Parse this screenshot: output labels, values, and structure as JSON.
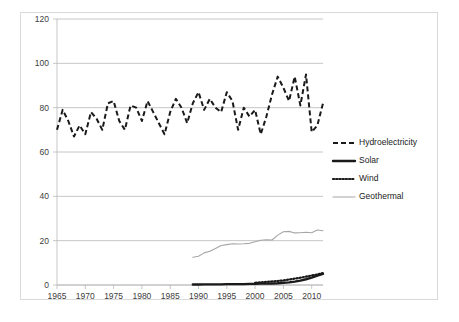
{
  "chart_data": {
    "type": "line",
    "title": "",
    "xlabel": "",
    "ylabel": "",
    "xlim": [
      1965,
      2012
    ],
    "ylim": [
      0,
      120
    ],
    "x_ticks": [
      1965,
      1970,
      1975,
      1980,
      1985,
      1990,
      1995,
      2000,
      2005,
      2010
    ],
    "y_ticks": [
      0,
      20,
      40,
      60,
      80,
      100,
      120
    ],
    "grid": "horizontal",
    "legend_position": "right",
    "series": [
      {
        "name": "Hydroelectricity",
        "style": "dashed",
        "color": "#1a1a1a",
        "x": [
          1965,
          1966,
          1967,
          1968,
          1969,
          1970,
          1971,
          1972,
          1973,
          1974,
          1975,
          1976,
          1977,
          1978,
          1979,
          1980,
          1981,
          1982,
          1983,
          1984,
          1985,
          1986,
          1987,
          1988,
          1989,
          1990,
          1991,
          1992,
          1993,
          1994,
          1995,
          1996,
          1997,
          1998,
          1999,
          2000,
          2001,
          2002,
          2003,
          2004,
          2005,
          2006,
          2007,
          2008,
          2009,
          2010,
          2011,
          2012
        ],
        "values": [
          70,
          79,
          74,
          67,
          72,
          68,
          78,
          75,
          70,
          82,
          83,
          74,
          70,
          81,
          80,
          74,
          83,
          78,
          73,
          68,
          78,
          84,
          80,
          73,
          82,
          87,
          79,
          84,
          80,
          78,
          87,
          83,
          70,
          80,
          76,
          79,
          68,
          76,
          86,
          94,
          89,
          83,
          94,
          81,
          95,
          69,
          72,
          82
        ]
      },
      {
        "name": "Solar",
        "style": "solid-thick",
        "color": "#1a1a1a",
        "x": [
          1989,
          1990,
          1991,
          1992,
          1993,
          1994,
          1995,
          1996,
          1997,
          1998,
          1999,
          2000,
          2001,
          2002,
          2003,
          2004,
          2005,
          2006,
          2007,
          2008,
          2009,
          2010,
          2011,
          2012
        ],
        "values": [
          0.2,
          0.2,
          0.3,
          0.3,
          0.3,
          0.3,
          0.4,
          0.4,
          0.4,
          0.4,
          0.5,
          0.5,
          0.6,
          0.6,
          0.7,
          0.8,
          1.0,
          1.2,
          1.5,
          2.0,
          2.6,
          3.3,
          4.2,
          5.0
        ]
      },
      {
        "name": "Wind",
        "style": "dotted",
        "color": "#1a1a1a",
        "x": [
          2000,
          2001,
          2002,
          2003,
          2004,
          2005,
          2006,
          2007,
          2008,
          2009,
          2010,
          2011,
          2012
        ],
        "values": [
          1.0,
          1.2,
          1.4,
          1.6,
          1.8,
          2.1,
          2.5,
          2.9,
          3.3,
          3.8,
          4.3,
          4.8,
          5.4
        ]
      },
      {
        "name": "Geothermal",
        "style": "solid-thin",
        "color": "#a6a6a6",
        "x": [
          1989,
          1990,
          1991,
          1992,
          1993,
          1994,
          1995,
          1996,
          1997,
          1998,
          1999,
          2000,
          2001,
          2002,
          2003,
          2004,
          2005,
          2006,
          2007,
          2008,
          2009,
          2010,
          2011,
          2012
        ],
        "values": [
          12.5,
          13.0,
          14.5,
          15.2,
          16.5,
          17.8,
          18.2,
          18.6,
          18.5,
          18.6,
          18.8,
          19.5,
          20.2,
          20.4,
          20.3,
          22.5,
          24.0,
          24.2,
          23.5,
          23.6,
          23.8,
          23.6,
          24.8,
          24.5
        ]
      }
    ]
  },
  "axis": {
    "y_tick_labels": [
      "0",
      "20",
      "40",
      "60",
      "80",
      "100",
      "120"
    ],
    "x_tick_labels": [
      "1965",
      "1970",
      "1975",
      "1980",
      "1985",
      "1990",
      "1995",
      "2000",
      "2005",
      "2010"
    ]
  },
  "legend": {
    "entries": [
      {
        "label": "Hydroelectricity",
        "style": "dashed",
        "color": "#1a1a1a"
      },
      {
        "label": "Solar",
        "style": "solid-thick",
        "color": "#1a1a1a"
      },
      {
        "label": "Wind",
        "style": "dotted",
        "color": "#1a1a1a"
      },
      {
        "label": "Geothermal",
        "style": "solid-thin",
        "color": "#a6a6a6"
      }
    ]
  }
}
